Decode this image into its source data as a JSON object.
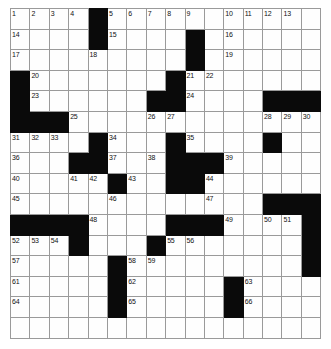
{
  "puzzle": {
    "kind": "crossword-grid",
    "rows": 16,
    "cols": 16,
    "colors": {
      "block": "#0a0a0a",
      "cell": "#fefefe",
      "gridline": "#9a9a9a",
      "border": "#6f6f6f",
      "number": "#111111"
    },
    "blocks": [
      [
        0,
        4
      ],
      [
        1,
        4
      ],
      [
        1,
        9
      ],
      [
        2,
        9
      ],
      [
        3,
        0
      ],
      [
        3,
        8
      ],
      [
        4,
        0
      ],
      [
        4,
        7
      ],
      [
        4,
        8
      ],
      [
        4,
        13
      ],
      [
        4,
        14
      ],
      [
        4,
        15
      ],
      [
        5,
        0
      ],
      [
        5,
        1
      ],
      [
        5,
        2
      ],
      [
        6,
        4
      ],
      [
        6,
        8
      ],
      [
        6,
        13
      ],
      [
        7,
        3
      ],
      [
        7,
        4
      ],
      [
        7,
        8
      ],
      [
        7,
        9
      ],
      [
        7,
        10
      ],
      [
        8,
        5
      ],
      [
        8,
        8
      ],
      [
        8,
        9
      ],
      [
        9,
        13
      ],
      [
        9,
        14
      ],
      [
        9,
        15
      ],
      [
        10,
        0
      ],
      [
        10,
        1
      ],
      [
        10,
        2
      ],
      [
        10,
        3
      ],
      [
        10,
        8
      ],
      [
        10,
        9
      ],
      [
        10,
        10
      ],
      [
        10,
        15
      ],
      [
        11,
        3
      ],
      [
        11,
        7
      ],
      [
        11,
        15
      ],
      [
        12,
        5
      ],
      [
        12,
        15
      ],
      [
        13,
        5
      ],
      [
        13,
        11
      ],
      [
        14,
        5
      ],
      [
        14,
        11
      ]
    ],
    "numbers": [
      {
        "row": 0,
        "col": 0,
        "label": "1"
      },
      {
        "row": 0,
        "col": 1,
        "label": "2"
      },
      {
        "row": 0,
        "col": 2,
        "label": "3"
      },
      {
        "row": 0,
        "col": 3,
        "label": "4"
      },
      {
        "row": 0,
        "col": 5,
        "label": "5"
      },
      {
        "row": 0,
        "col": 6,
        "label": "6"
      },
      {
        "row": 0,
        "col": 7,
        "label": "7"
      },
      {
        "row": 0,
        "col": 8,
        "label": "8"
      },
      {
        "row": 0,
        "col": 9,
        "label": "9"
      },
      {
        "row": 0,
        "col": 11,
        "label": "10"
      },
      {
        "row": 0,
        "col": 12,
        "label": "11"
      },
      {
        "row": 0,
        "col": 13,
        "label": "12"
      },
      {
        "row": 0,
        "col": 14,
        "label": "13"
      },
      {
        "row": 1,
        "col": 0,
        "label": "14"
      },
      {
        "row": 1,
        "col": 5,
        "label": "15"
      },
      {
        "row": 1,
        "col": 11,
        "label": "16"
      },
      {
        "row": 2,
        "col": 0,
        "label": "17"
      },
      {
        "row": 2,
        "col": 4,
        "label": "18"
      },
      {
        "row": 2,
        "col": 11,
        "label": "19"
      },
      {
        "row": 3,
        "col": 1,
        "label": "20"
      },
      {
        "row": 3,
        "col": 9,
        "label": "21"
      },
      {
        "row": 3,
        "col": 10,
        "label": "22"
      },
      {
        "row": 4,
        "col": 1,
        "label": "23"
      },
      {
        "row": 4,
        "col": 9,
        "label": "24"
      },
      {
        "row": 5,
        "col": 3,
        "label": "25"
      },
      {
        "row": 5,
        "col": 7,
        "label": "26"
      },
      {
        "row": 5,
        "col": 8,
        "label": "27"
      },
      {
        "row": 5,
        "col": 13,
        "label": "28"
      },
      {
        "row": 5,
        "col": 14,
        "label": "29"
      },
      {
        "row": 5,
        "col": 15,
        "label": "30"
      },
      {
        "row": 6,
        "col": 0,
        "label": "31"
      },
      {
        "row": 6,
        "col": 1,
        "label": "32"
      },
      {
        "row": 6,
        "col": 2,
        "label": "33"
      },
      {
        "row": 6,
        "col": 5,
        "label": "34"
      },
      {
        "row": 6,
        "col": 9,
        "label": "35"
      },
      {
        "row": 7,
        "col": 0,
        "label": "36"
      },
      {
        "row": 7,
        "col": 5,
        "label": "37"
      },
      {
        "row": 7,
        "col": 7,
        "label": "38"
      },
      {
        "row": 7,
        "col": 11,
        "label": "39"
      },
      {
        "row": 8,
        "col": 0,
        "label": "40"
      },
      {
        "row": 8,
        "col": 3,
        "label": "41"
      },
      {
        "row": 8,
        "col": 4,
        "label": "42"
      },
      {
        "row": 8,
        "col": 6,
        "label": "43"
      },
      {
        "row": 8,
        "col": 10,
        "label": "44"
      },
      {
        "row": 9,
        "col": 0,
        "label": "45"
      },
      {
        "row": 9,
        "col": 5,
        "label": "46"
      },
      {
        "row": 9,
        "col": 10,
        "label": "47"
      },
      {
        "row": 10,
        "col": 4,
        "label": "48"
      },
      {
        "row": 10,
        "col": 11,
        "label": "49"
      },
      {
        "row": 10,
        "col": 13,
        "label": "50"
      },
      {
        "row": 10,
        "col": 14,
        "label": "51"
      },
      {
        "row": 11,
        "col": 0,
        "label": "52"
      },
      {
        "row": 11,
        "col": 1,
        "label": "53"
      },
      {
        "row": 11,
        "col": 2,
        "label": "54"
      },
      {
        "row": 11,
        "col": 8,
        "label": "55"
      },
      {
        "row": 11,
        "col": 9,
        "label": "56"
      },
      {
        "row": 12,
        "col": 0,
        "label": "57"
      },
      {
        "row": 12,
        "col": 6,
        "label": "58"
      },
      {
        "row": 12,
        "col": 7,
        "label": "59"
      },
      {
        "row": 12,
        "col": 15,
        "label": "60"
      },
      {
        "row": 13,
        "col": 0,
        "label": "61"
      },
      {
        "row": 13,
        "col": 6,
        "label": "62"
      },
      {
        "row": 13,
        "col": 12,
        "label": "63"
      },
      {
        "row": 14,
        "col": 0,
        "label": "64"
      },
      {
        "row": 14,
        "col": 6,
        "label": "65"
      },
      {
        "row": 14,
        "col": 12,
        "label": "66"
      }
    ]
  }
}
